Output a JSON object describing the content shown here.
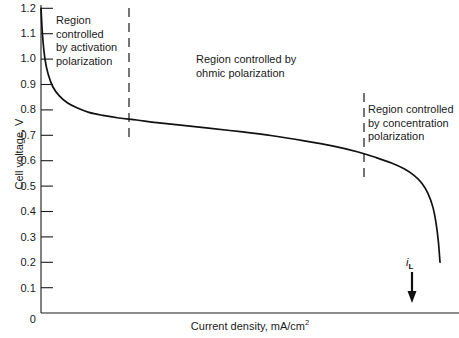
{
  "chart_data": {
    "type": "line",
    "title": "",
    "xlabel": "Current density,  mA/cm",
    "xlabel_exponent": "2",
    "ylabel": "Cell voltage, V",
    "ylim": [
      0,
      1.2
    ],
    "xlim": [
      0,
      1
    ],
    "grid": false,
    "legend": null,
    "y_ticks": [
      "0",
      "0.1",
      "0.2",
      "0.3",
      "0.4",
      "0.5",
      "0.6",
      "0.7",
      "0.8",
      "0.9",
      "1.0",
      "1.1",
      "1.2"
    ],
    "x_ticks": [],
    "series": [
      {
        "name": "Polarization curve",
        "x": [
          0.0,
          0.004,
          0.01,
          0.018,
          0.03,
          0.046,
          0.066,
          0.09,
          0.12,
          0.155,
          0.195,
          0.24,
          0.29,
          0.35,
          0.42,
          0.5,
          0.58,
          0.66,
          0.73,
          0.79,
          0.84,
          0.88,
          0.91,
          0.935,
          0.955,
          0.97,
          0.982,
          0.99,
          0.996,
          1.0
        ],
        "y": [
          1.2,
          1.09,
          1.0,
          0.94,
          0.89,
          0.855,
          0.828,
          0.808,
          0.79,
          0.778,
          0.768,
          0.76,
          0.75,
          0.74,
          0.728,
          0.714,
          0.698,
          0.678,
          0.658,
          0.636,
          0.612,
          0.59,
          0.568,
          0.542,
          0.51,
          0.47,
          0.418,
          0.355,
          0.28,
          0.2
        ]
      }
    ],
    "annotations": [
      {
        "id": "activation",
        "text": "Region\ncontrolled\nby activation\npolarization"
      },
      {
        "id": "ohmic",
        "text": "Region controlled by\nohmic polarization"
      },
      {
        "id": "concentration",
        "text": "Region controlled\nby concentration\npolarization"
      }
    ],
    "limiting_current": {
      "symbol": "i",
      "subscript": "L"
    },
    "dividers": [
      {
        "id": "divider-activation-ohmic",
        "x_fraction": 0.2105
      },
      {
        "id": "divider-ohmic-concentration",
        "x_fraction": 0.7727
      }
    ]
  }
}
